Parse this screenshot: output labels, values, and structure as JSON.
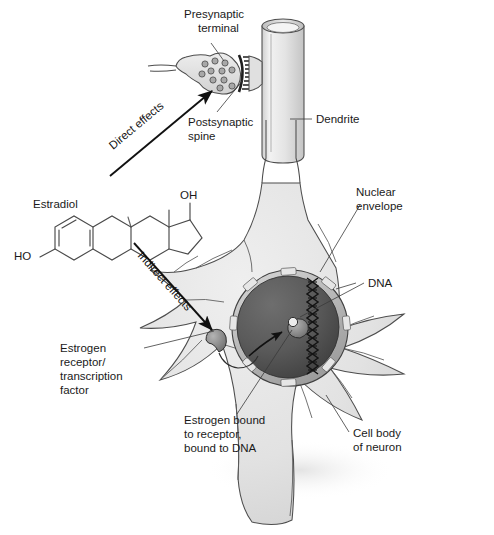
{
  "figure": {
    "background_color": "#ffffff"
  },
  "labels": {
    "presynaptic_terminal": "Presynaptic\nterminal",
    "presynaptic_terminal_line1": "Presynaptic",
    "presynaptic_terminal_line2": "terminal",
    "postsynaptic_spine_line1": "Postsynaptic",
    "postsynaptic_spine_line2": "spine",
    "dendrite": "Dendrite",
    "estradiol": "Estradiol",
    "direct_effects": "Direct effects",
    "indirect_effects": "Indirect effects",
    "nuclear_envelope_line1": "Nuclear",
    "nuclear_envelope_line2": "envelope",
    "dna": "DNA",
    "estrogen_receptor_line1": "Estrogen",
    "estrogen_receptor_line2": "receptor/",
    "estrogen_receptor_line3": "transcription",
    "estrogen_receptor_line4": "factor",
    "estrogen_bound_line1": "Estrogen bound",
    "estrogen_bound_line2": "to receptor,",
    "estrogen_bound_line3": "bound to DNA",
    "cell_body_line1": "Cell body",
    "cell_body_line2": "of neuron"
  },
  "chemical": {
    "name": "Estradiol",
    "hydroxyl_c17": "OH",
    "hydroxyl_c3": "HO",
    "ring_count": 4,
    "aromatic_ring": "A"
  },
  "colors": {
    "cell_fill": "#e3e3e3",
    "cell_stroke": "#4d4d4d",
    "nucleus_dark": "#585858",
    "nucleus_rim": "#c8c8c8",
    "dendrite_fill": "#e6e6e6",
    "terminal_fill": "#dedede",
    "vesicle_fill": "#a8a8a8",
    "cleft_dark": "#1f1f1f",
    "receptor_fill": "#8a8a8a",
    "text": "#1a1a1a",
    "arrow": "#111111"
  },
  "structures": {
    "vesicle_count": 11,
    "nuclear_pore_count": 8,
    "dendrite_branches": 7,
    "dna_strand": "double-helix zigzag"
  }
}
